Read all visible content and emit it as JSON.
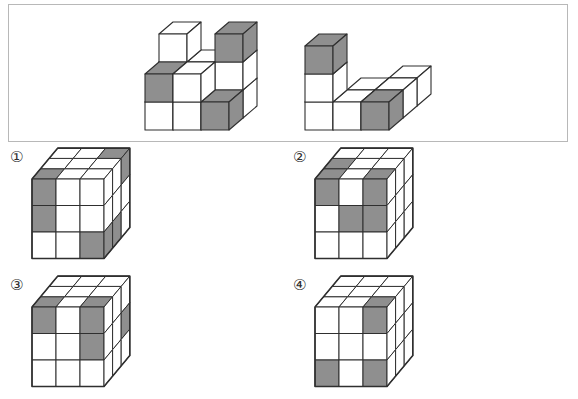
{
  "colors": {
    "shaded": "#8f8f8f",
    "face": "#ffffff",
    "line": "#2f2f2f",
    "box_border": "#b8b8b8",
    "page_bg": "#ffffff"
  },
  "problem_box": {
    "pieces": [
      {
        "id": "left-piece",
        "voxels": [
          {
            "x": 0,
            "y": 0,
            "z": 1,
            "s": 0
          },
          {
            "x": 1,
            "y": 0,
            "z": 1,
            "s": 0
          },
          {
            "x": 2,
            "y": 0,
            "z": 1,
            "s": 0
          },
          {
            "x": 0,
            "y": 1,
            "z": 1,
            "s": 0
          },
          {
            "x": 1,
            "y": 1,
            "z": 1,
            "s": 0
          },
          {
            "x": 2,
            "y": 1,
            "z": 1,
            "s": 0
          },
          {
            "x": 0,
            "y": 2,
            "z": 1,
            "s": 0
          },
          {
            "x": 2,
            "y": 2,
            "z": 1,
            "s": 1
          },
          {
            "x": 0,
            "y": 0,
            "z": 0,
            "s": 0
          },
          {
            "x": 1,
            "y": 0,
            "z": 0,
            "s": 0
          },
          {
            "x": 2,
            "y": 0,
            "z": 0,
            "s": 1
          },
          {
            "x": 0,
            "y": 1,
            "z": 0,
            "s": 1
          },
          {
            "x": 1,
            "y": 1,
            "z": 0,
            "s": 0
          }
        ]
      },
      {
        "id": "right-piece",
        "voxels": [
          {
            "x": 2,
            "y": 0,
            "z": 2,
            "s": 0
          },
          {
            "x": 1,
            "y": 0,
            "z": 1,
            "s": 0
          },
          {
            "x": 2,
            "y": 0,
            "z": 1,
            "s": 0
          },
          {
            "x": 0,
            "y": 0,
            "z": 0,
            "s": 0
          },
          {
            "x": 1,
            "y": 0,
            "z": 0,
            "s": 0
          },
          {
            "x": 2,
            "y": 0,
            "z": 0,
            "s": 1
          },
          {
            "x": 0,
            "y": 1,
            "z": 0,
            "s": 0
          },
          {
            "x": 0,
            "y": 2,
            "z": 0,
            "s": 1
          }
        ]
      }
    ]
  },
  "options": [
    {
      "label": "①",
      "top": [
        [
          0,
          0,
          1
        ],
        [
          0,
          0,
          0
        ],
        [
          1,
          0,
          0
        ]
      ],
      "front": [
        [
          1,
          0,
          0
        ],
        [
          1,
          0,
          0
        ],
        [
          0,
          0,
          1
        ]
      ],
      "right": [
        [
          0,
          0,
          1
        ],
        [
          0,
          0,
          0
        ],
        [
          1,
          1,
          0
        ]
      ]
    },
    {
      "label": "②",
      "top": [
        [
          0,
          0,
          0
        ],
        [
          1,
          0,
          0
        ],
        [
          1,
          0,
          1
        ]
      ],
      "front": [
        [
          1,
          0,
          1
        ],
        [
          0,
          1,
          1
        ],
        [
          0,
          0,
          0
        ]
      ],
      "right": [
        [
          0,
          0,
          0
        ],
        [
          0,
          0,
          0
        ],
        [
          0,
          0,
          0
        ]
      ]
    },
    {
      "label": "③",
      "top": [
        [
          0,
          0,
          0
        ],
        [
          0,
          0,
          0
        ],
        [
          1,
          0,
          1
        ]
      ],
      "front": [
        [
          1,
          0,
          1
        ],
        [
          0,
          0,
          1
        ],
        [
          0,
          0,
          0
        ]
      ],
      "right": [
        [
          0,
          0,
          0
        ],
        [
          0,
          0,
          1
        ],
        [
          0,
          0,
          0
        ]
      ]
    },
    {
      "label": "④",
      "top": [
        [
          0,
          0,
          0
        ],
        [
          0,
          0,
          0
        ],
        [
          0,
          0,
          1
        ]
      ],
      "front": [
        [
          0,
          0,
          1
        ],
        [
          0,
          0,
          0
        ],
        [
          1,
          0,
          1
        ]
      ],
      "right": [
        [
          0,
          0,
          0
        ],
        [
          0,
          0,
          0
        ],
        [
          0,
          0,
          0
        ]
      ]
    }
  ]
}
